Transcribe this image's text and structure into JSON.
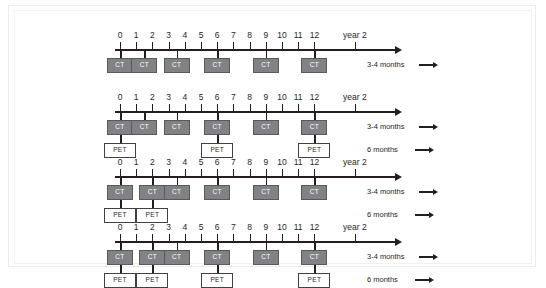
{
  "figure": {
    "background_color": "#ffffff",
    "frame_color": "#ececec",
    "ct_fill_color": "#808285",
    "ct_border_color": "#58595b",
    "pet_fill_color": "#ffffff",
    "pet_border_color": "#414042",
    "axis_color": "#231f20"
  },
  "labels": {
    "ct": "CT",
    "pet": "PET",
    "year2": "year 2",
    "interval_ct": "3-4 months",
    "interval_pet": "6 months"
  },
  "axis": {
    "ticks": [
      "0",
      "1",
      "2",
      "3",
      "4",
      "5",
      "6",
      "7",
      "8",
      "9",
      "10",
      "11",
      "12"
    ],
    "tick_values": [
      0,
      1,
      2,
      3,
      4,
      5,
      6,
      7,
      8,
      9,
      10,
      11,
      12
    ],
    "year2_value": 14.5,
    "axis_min": 0,
    "axis_max": 17
  },
  "chart_data": {
    "type": "table",
    "xlabel": "months",
    "ylabel": "",
    "categories": [
      "0",
      "1",
      "2",
      "3",
      "4",
      "5",
      "6",
      "7",
      "8",
      "9",
      "10",
      "11",
      "12",
      "year 2"
    ],
    "legend": [
      "3-4 months",
      "6 months"
    ],
    "rows": [
      {
        "row_index": 1,
        "ct_positions": [
          0,
          1.5,
          3.5,
          6,
          9,
          12
        ],
        "pet_positions": [],
        "legend_ct": "3-4 months",
        "legend_pet": ""
      },
      {
        "row_index": 2,
        "ct_positions": [
          0,
          1.5,
          3.5,
          6,
          9,
          12
        ],
        "pet_positions": [
          0,
          6,
          12
        ],
        "legend_ct": "3-4 months",
        "legend_pet": "6 months"
      },
      {
        "row_index": 3,
        "ct_positions": [
          0,
          2,
          3.5,
          6,
          9,
          12
        ],
        "pet_positions": [
          0,
          2
        ],
        "legend_ct": "3-4 months",
        "legend_pet": "6 months"
      },
      {
        "row_index": 4,
        "ct_positions": [
          0,
          2,
          3.5,
          6,
          9,
          12
        ],
        "pet_positions": [
          0,
          2,
          6,
          12
        ],
        "legend_ct": "3-4 months",
        "legend_pet": "6 months"
      }
    ]
  }
}
